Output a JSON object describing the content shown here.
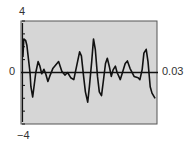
{
  "chart_data": {
    "type": "line",
    "title": "",
    "xlabel": "",
    "ylabel": "",
    "xlim": [
      0,
      0.03
    ],
    "ylim": [
      -4,
      4
    ],
    "grid": false,
    "legend": null,
    "tick_labels": {
      "y_max": "4",
      "y_min": "−4",
      "x_min": "0",
      "x_max": "0.03"
    },
    "y_ticks": [
      -4,
      -3,
      -2,
      -1,
      0,
      1,
      2,
      3,
      4
    ],
    "series": [
      {
        "name": "waveform",
        "x": [
          0.0002,
          0.0004,
          0.0008,
          0.0011,
          0.0018,
          0.002,
          0.0024,
          0.0031,
          0.0036,
          0.004,
          0.0044,
          0.0049,
          0.0053,
          0.0058,
          0.0062,
          0.0069,
          0.0082,
          0.0089,
          0.0096,
          0.0102,
          0.0109,
          0.0116,
          0.0129,
          0.0133,
          0.0138,
          0.0142,
          0.0147,
          0.0151,
          0.0156,
          0.016,
          0.0164,
          0.0169,
          0.0173,
          0.0178,
          0.0182,
          0.0187,
          0.0191,
          0.0196,
          0.02,
          0.0204,
          0.0209,
          0.0213,
          0.022,
          0.0224,
          0.0231,
          0.0236,
          0.0242,
          0.0251,
          0.026,
          0.0264,
          0.0269,
          0.0273,
          0.0278,
          0.0282,
          0.0287,
          0.0291,
          0.0298
        ],
        "y": [
          1.2,
          2.6,
          2.5,
          2.1,
          0.0,
          -1.1,
          -1.9,
          0.0,
          0.85,
          0.5,
          -0.1,
          0.25,
          -0.1,
          -0.7,
          -0.3,
          0.3,
          0.85,
          0.1,
          -0.2,
          0.0,
          -0.4,
          -0.55,
          1.6,
          1.3,
          -0.3,
          -1.5,
          -2.3,
          -1.1,
          0.85,
          2.6,
          1.8,
          -0.3,
          -1.5,
          -1.8,
          -0.7,
          0.7,
          1.1,
          0.4,
          -0.3,
          0.2,
          0.5,
          0.0,
          -0.55,
          -0.1,
          0.7,
          0.9,
          0.3,
          -0.3,
          -0.4,
          -0.55,
          0.25,
          1.5,
          1.8,
          0.85,
          -1.1,
          -1.6,
          -2.0
        ]
      }
    ]
  },
  "colors": {
    "plot_background": "#d6d6d6",
    "frame": "#555555",
    "line": "#111111",
    "label_text": "#333333"
  }
}
